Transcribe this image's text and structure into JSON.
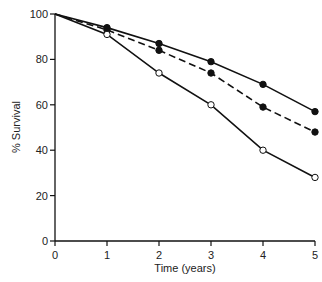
{
  "chart_data": {
    "type": "line",
    "title": "",
    "xlabel": "Time (years)",
    "ylabel": "% Survival",
    "x": [
      0,
      1,
      2,
      3,
      4,
      5
    ],
    "xlim": [
      0,
      5
    ],
    "ylim": [
      0,
      100
    ],
    "xticks": [
      "0",
      "1",
      "2",
      "3",
      "4",
      "5"
    ],
    "yticks": [
      "0",
      "20",
      "40",
      "60",
      "80",
      "100"
    ],
    "grid": false,
    "legend": null,
    "series": [
      {
        "name": "solid line, filled circles",
        "style": "solid",
        "marker": "filled-circle",
        "values": [
          100,
          94,
          87,
          79,
          69,
          57
        ]
      },
      {
        "name": "dashed line, filled circles",
        "style": "dashed",
        "marker": "filled-circle",
        "values": [
          100,
          93,
          84,
          74,
          59,
          48
        ]
      },
      {
        "name": "solid line, open circles",
        "style": "solid",
        "marker": "open-circle",
        "values": [
          100,
          91,
          74,
          60,
          40,
          28
        ]
      }
    ]
  },
  "colors": {
    "line": "#111111",
    "background": "#ffffff"
  }
}
